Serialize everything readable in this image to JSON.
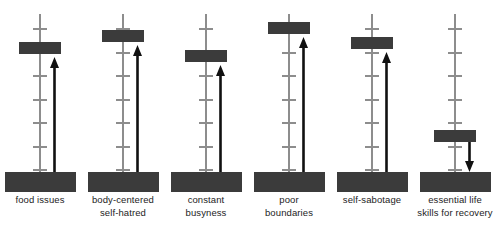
{
  "figure": {
    "type": "diagram",
    "colors": {
      "marker": "#3b3b3b",
      "base_block": "#3b3b3b",
      "scale_line": "#8d8d8d",
      "tick": "#8d8d8d",
      "arrow": "#111111",
      "background": "#ffffff",
      "label_text": "#1c1c1c"
    }
  },
  "columns": [
    {
      "id": "food-issues",
      "label_lines": [
        "food issues"
      ],
      "x": 0,
      "scale": {
        "top": 14,
        "bottom": 175,
        "ticks": 7
      },
      "marker": {
        "top": 42,
        "height": 12
      },
      "arrow": {
        "direction": "up",
        "tip_y": 57,
        "tail_y": 176
      }
    },
    {
      "id": "body-centered-self-hatred",
      "label_lines": [
        "body-centered",
        "self-hatred"
      ],
      "x": 83,
      "scale": {
        "top": 14,
        "bottom": 175,
        "ticks": 7
      },
      "marker": {
        "top": 30,
        "height": 12
      },
      "arrow": {
        "direction": "up",
        "tip_y": 45,
        "tail_y": 176
      }
    },
    {
      "id": "constant-busyness",
      "label_lines": [
        "constant",
        "busyness"
      ],
      "x": 166,
      "scale": {
        "top": 14,
        "bottom": 175,
        "ticks": 7
      },
      "marker": {
        "top": 50,
        "height": 12
      },
      "arrow": {
        "direction": "up",
        "tip_y": 65,
        "tail_y": 176
      }
    },
    {
      "id": "poor-boundaries",
      "label_lines": [
        "poor",
        "boundaries"
      ],
      "x": 249,
      "scale": {
        "top": 14,
        "bottom": 175,
        "ticks": 7
      },
      "marker": {
        "top": 22,
        "height": 12
      },
      "arrow": {
        "direction": "up",
        "tip_y": 37,
        "tail_y": 176
      }
    },
    {
      "id": "self-sabotage",
      "label_lines": [
        "self-sabotage"
      ],
      "x": 332,
      "scale": {
        "top": 14,
        "bottom": 175,
        "ticks": 7
      },
      "marker": {
        "top": 37,
        "height": 12
      },
      "arrow": {
        "direction": "up",
        "tip_y": 52,
        "tail_y": 176
      }
    },
    {
      "id": "essential-life-skills-for-recovery",
      "label_lines": [
        "essential life",
        "skills for recovery"
      ],
      "x": 415,
      "scale": {
        "top": 14,
        "bottom": 175,
        "ticks": 7
      },
      "marker": {
        "top": 130,
        "height": 12
      },
      "arrow": {
        "direction": "down",
        "tip_y": 172,
        "tail_y": 142
      }
    }
  ]
}
